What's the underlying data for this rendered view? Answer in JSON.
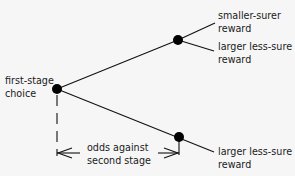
{
  "diagram": {
    "type": "decision-tree",
    "background": "#f6f6f6",
    "line_color": "#111111",
    "nodes": {
      "root": {
        "label_line1": "first-stage",
        "label_line2": "choice",
        "x": 57,
        "y": 89
      },
      "upper": {
        "x": 178,
        "y": 40
      },
      "lower": {
        "x": 179,
        "y": 138
      }
    },
    "outcomes": {
      "upper_a": {
        "line1": "smaller-surer",
        "line2": "reward"
      },
      "upper_b": {
        "line1": "larger less-sure",
        "line2": "reward"
      },
      "lower_a": {
        "line1": "larger less-sure",
        "line2": "reward"
      }
    },
    "annotation": {
      "line1": "odds against",
      "line2": "second stage"
    }
  }
}
